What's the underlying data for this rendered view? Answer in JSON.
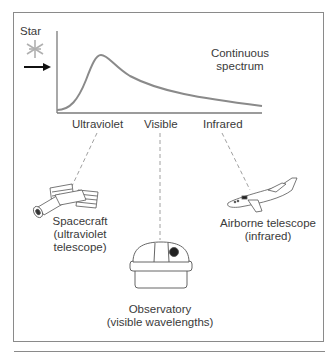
{
  "figure": {
    "star_label": "Star",
    "curve_label_line1": "Continuous",
    "curve_label_line2": "spectrum",
    "axis_labels": [
      "Ultraviolet",
      "Visible",
      "Infrared"
    ],
    "instruments": [
      {
        "name": "spacecraft",
        "line1": "Spacecraft",
        "line2": "(ultraviolet",
        "line3": "telescope)"
      },
      {
        "name": "observatory",
        "line1": "Observatory",
        "line2": "(visible wavelengths)"
      },
      {
        "name": "airborne",
        "line1": "Airborne telescope",
        "line2": "(infrared)"
      }
    ]
  },
  "colors": {
    "curve": "#8a8a8a",
    "axis": "#7a7a7a",
    "star": "#b0b0b0",
    "arrow": "#111111",
    "dashes": "#9a9a9a",
    "frame": "#8a8a8a"
  }
}
